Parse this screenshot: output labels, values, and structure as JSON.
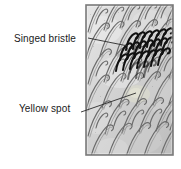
{
  "figure": {
    "kind": "annotated-micrograph",
    "panel": {
      "name": "bristle-micrograph-panel",
      "bounds": {
        "x": 86,
        "y": 5,
        "width": 87,
        "height": 150
      },
      "border_color": "#7a7a7a",
      "fill_color": "#d8d8d8"
    },
    "annotations": [
      {
        "id": "singed-bristle",
        "label": "Singed bristle",
        "text_position": {
          "x": 14,
          "y": 33
        },
        "leader_from": {
          "x": 88,
          "y": 38
        },
        "leader_to": {
          "x": 128,
          "y": 45
        },
        "target_color": "#1a1a1a"
      },
      {
        "id": "yellow-spot",
        "label": "Yellow spot",
        "text_position": {
          "x": 19,
          "y": 103
        },
        "leader_from": {
          "x": 81,
          "y": 112
        },
        "leader_to": {
          "x": 136,
          "y": 93
        },
        "target_color": "#cfcfc2"
      }
    ],
    "colors": {
      "background": "#ffffff",
      "text": "#1a1a1a",
      "leader_line": "#2b2b2b",
      "bristle_light": "#6f6f6f",
      "bristle_dark": "#111111",
      "panel_light": "#e2e2e2",
      "panel_mid": "#c9c9c9",
      "panel_shadow": "#b0b0b0"
    }
  }
}
